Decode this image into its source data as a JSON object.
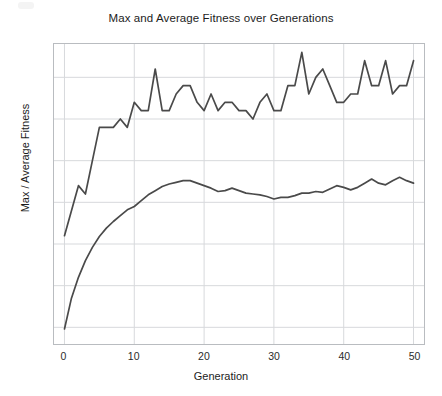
{
  "chart_data": {
    "type": "line",
    "title": "Max and Average Fitness over Generations",
    "xlabel": "Generation",
    "ylabel": "Max / Average Fitness",
    "xlim": [
      -1.5,
      51.5
    ],
    "ylim": [
      48.0,
      84.0
    ],
    "xticks": [
      0,
      10,
      20,
      30,
      40,
      50
    ],
    "yticks": [
      50,
      55,
      60,
      65,
      70,
      75,
      80
    ],
    "grid": true,
    "legend": "none",
    "line_color": "#4a4a4a",
    "grid_color": "#d7d9dc",
    "frame_color": "#b9bcc0",
    "background": "#ffffff",
    "x": [
      0,
      1,
      2,
      3,
      4,
      5,
      6,
      7,
      8,
      9,
      10,
      11,
      12,
      13,
      14,
      15,
      16,
      17,
      18,
      19,
      20,
      21,
      22,
      23,
      24,
      25,
      26,
      27,
      28,
      29,
      30,
      31,
      32,
      33,
      34,
      35,
      36,
      37,
      38,
      39,
      40,
      41,
      42,
      43,
      44,
      45,
      46,
      47,
      48,
      49,
      50
    ],
    "series": [
      {
        "name": "Max Fitness",
        "values": [
          61,
          64,
          67,
          66,
          70,
          74,
          74,
          74,
          75,
          74,
          77,
          76,
          76,
          81,
          76,
          76,
          78,
          79,
          79,
          77,
          76,
          78,
          76,
          77,
          77,
          76,
          76,
          75,
          77,
          78,
          76,
          76,
          79,
          79,
          83,
          78,
          80,
          81,
          79,
          77,
          77,
          78,
          78,
          82,
          79,
          79,
          82,
          78,
          79,
          79,
          82
        ]
      },
      {
        "name": "Average Fitness",
        "values": [
          49.8,
          53.5,
          56.0,
          58.0,
          59.6,
          60.9,
          61.9,
          62.7,
          63.4,
          64.1,
          64.5,
          65.2,
          65.9,
          66.4,
          66.9,
          67.2,
          67.4,
          67.6,
          67.6,
          67.3,
          67.0,
          66.7,
          66.3,
          66.4,
          66.7,
          66.4,
          66.1,
          66.0,
          65.9,
          65.7,
          65.4,
          65.6,
          65.6,
          65.8,
          66.1,
          66.1,
          66.3,
          66.2,
          66.6,
          67.0,
          66.8,
          66.5,
          66.8,
          67.3,
          67.8,
          67.3,
          67.1,
          67.6,
          68.0,
          67.6,
          67.3
        ]
      }
    ]
  }
}
